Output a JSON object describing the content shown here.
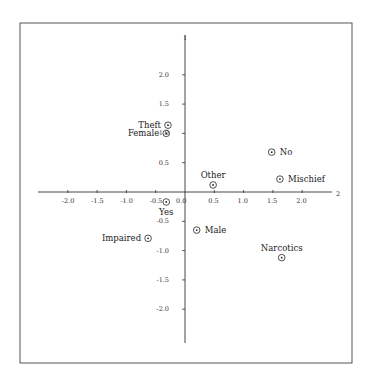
{
  "chart_data": {
    "type": "scatter",
    "title": "",
    "xlabel": "2",
    "ylabel": "1",
    "xlim": [
      -2.5,
      2.5
    ],
    "ylim": [
      -2.6,
      2.65
    ],
    "grid": false,
    "legend": null,
    "x_ticks": [
      "-2.0",
      "-1.5",
      "-1.0",
      "-0.5",
      "0.0",
      "0.5",
      "1.0",
      "1.5",
      "2.0"
    ],
    "y_ticks": [
      "2.0",
      "1.5",
      "1.0",
      "0.5",
      "-0.5",
      "-1.0",
      "-1.5",
      "-2.0"
    ],
    "points": [
      {
        "label": "Theft",
        "x": -0.29,
        "y": 1.14,
        "label_pos": "left"
      },
      {
        "label": "Female",
        "x": -0.32,
        "y": 1.0,
        "label_pos": "left"
      },
      {
        "label": "No",
        "x": 1.48,
        "y": 0.68,
        "label_pos": "right"
      },
      {
        "label": "Mischief",
        "x": 1.62,
        "y": 0.22,
        "label_pos": "right"
      },
      {
        "label": "Other",
        "x": 0.48,
        "y": 0.12,
        "label_pos": "above"
      },
      {
        "label": "Yes",
        "x": -0.32,
        "y": -0.17,
        "label_pos": "below"
      },
      {
        "label": "Male",
        "x": 0.2,
        "y": -0.65,
        "label_pos": "right"
      },
      {
        "label": "Impaired",
        "x": -0.63,
        "y": -0.79,
        "label_pos": "left"
      },
      {
        "label": "Narcotics",
        "x": 1.65,
        "y": -1.12,
        "label_pos": "above"
      }
    ]
  },
  "colors": {
    "ink": "#222222",
    "frame": "#444444",
    "background": "#ffffff"
  }
}
